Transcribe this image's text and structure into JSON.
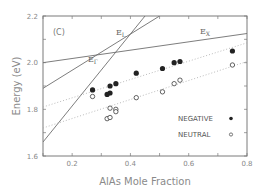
{
  "chart_data": {
    "type": "scatter",
    "title": "",
    "panel_label": "(C)",
    "xlabel": "AlAs Mole Fraction",
    "ylabel": "Energy (eV)",
    "xlim": [
      0.1,
      0.8
    ],
    "ylim": [
      1.6,
      2.2
    ],
    "xticks": [
      0.2,
      0.4,
      0.6,
      0.8
    ],
    "yticks": [
      1.6,
      1.8,
      2.0,
      2.2
    ],
    "grid": false,
    "legend_position": "lower right",
    "series": [
      {
        "name": "NEGATIVE",
        "marker": "filled-circle",
        "x": [
          0.27,
          0.32,
          0.33,
          0.33,
          0.35,
          0.42,
          0.51,
          0.55,
          0.57,
          0.75
        ],
        "y": [
          1.883,
          1.864,
          1.87,
          1.9,
          1.91,
          1.955,
          1.975,
          2.0,
          2.005,
          2.05
        ],
        "fit_line": {
          "style": "dotted",
          "x": [
            0.1,
            0.8
          ],
          "y": [
            1.81,
            2.085
          ]
        }
      },
      {
        "name": "NEUTRAL",
        "marker": "open-circle",
        "x": [
          0.27,
          0.33,
          0.35,
          0.35,
          0.32,
          0.33,
          0.42,
          0.51,
          0.55,
          0.57,
          0.75
        ],
        "y": [
          1.855,
          1.805,
          1.8,
          1.79,
          1.76,
          1.765,
          1.85,
          1.875,
          1.91,
          1.925,
          1.99
        ],
        "fit_line": {
          "style": "dotted",
          "x": [
            0.1,
            0.8
          ],
          "y": [
            1.72,
            2.005
          ]
        }
      }
    ],
    "reference_lines": [
      {
        "name": "E_X",
        "label": "E",
        "subscript": "X",
        "x": [
          0.1,
          0.8
        ],
        "y": [
          2.0,
          2.125
        ]
      },
      {
        "name": "E_L",
        "label": "E",
        "subscript": "L",
        "x": [
          0.1,
          0.5
        ],
        "y": [
          1.89,
          2.2
        ]
      },
      {
        "name": "E_Γ",
        "label": "E",
        "subscript": "Γ",
        "x": [
          0.1,
          0.45
        ],
        "y": [
          1.66,
          2.2
        ]
      }
    ],
    "legend": [
      {
        "label": "NEGATIVE",
        "marker": "filled-circle"
      },
      {
        "label": "NEUTRAL",
        "marker": "open-circle"
      }
    ]
  },
  "colors": {
    "axis": "#7a7a7a",
    "line": "#6e6e6e",
    "marker": "#222222",
    "dotted": "#aaaaaa"
  }
}
